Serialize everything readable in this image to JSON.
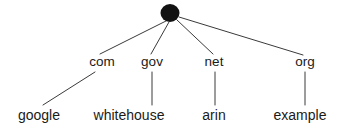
{
  "diagram": {
    "type": "tree",
    "title": "",
    "background_color": "#ffffff",
    "line_color": "#3a3a3a",
    "text_color": "#1a1a1a",
    "root": {
      "label": "",
      "shape": "filled-ellipse",
      "fill_color": "#121212",
      "cx": 170,
      "cy": 13,
      "rx": 9.5,
      "ry": 9
    },
    "levels": [
      {
        "name": "top-level-domains",
        "nodes": [
          {
            "id": "com",
            "label": "com",
            "x": 102,
            "y": 67
          },
          {
            "id": "gov",
            "label": "gov",
            "x": 152,
            "y": 67
          },
          {
            "id": "net",
            "label": "net",
            "x": 214,
            "y": 67
          },
          {
            "id": "org",
            "label": "org",
            "x": 305,
            "y": 67
          }
        ]
      },
      {
        "name": "second-level-domains",
        "nodes": [
          {
            "id": "google",
            "label": "google",
            "x": 39,
            "y": 120
          },
          {
            "id": "whitehouse",
            "label": "whitehouse",
            "x": 129,
            "y": 120
          },
          {
            "id": "arin",
            "label": "arin",
            "x": 214,
            "y": 120
          },
          {
            "id": "example",
            "label": "example",
            "x": 300,
            "y": 120
          }
        ]
      }
    ],
    "edges": [
      {
        "from": "root",
        "to": "com",
        "x1": 166,
        "y1": 21,
        "x2": 100,
        "y2": 54
      },
      {
        "from": "root",
        "to": "gov",
        "x1": 169,
        "y1": 22,
        "x2": 151,
        "y2": 54
      },
      {
        "from": "root",
        "to": "net",
        "x1": 177,
        "y1": 20,
        "x2": 213,
        "y2": 54
      },
      {
        "from": "root",
        "to": "org",
        "x1": 179,
        "y1": 17,
        "x2": 303,
        "y2": 55
      },
      {
        "from": "com",
        "to": "google",
        "x1": 95,
        "y1": 72,
        "x2": 43,
        "y2": 105
      },
      {
        "from": "gov",
        "to": "whitehouse",
        "x1": 152,
        "y1": 72,
        "x2": 152,
        "y2": 105
      },
      {
        "from": "net",
        "to": "arin",
        "x1": 215,
        "y1": 72,
        "x2": 215,
        "y2": 105
      },
      {
        "from": "org",
        "to": "example",
        "x1": 305,
        "y1": 72,
        "x2": 305,
        "y2": 105
      }
    ]
  }
}
